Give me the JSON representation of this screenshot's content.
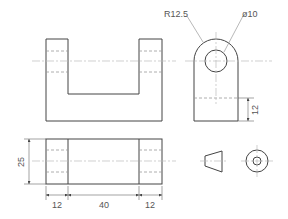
{
  "drawing": {
    "title": "Orthographic projection of a clevis bracket",
    "annotations": {
      "radius": "R12.5",
      "hole_diameter": "ø10"
    },
    "dimensions": {
      "side_slot_height": "12",
      "plan_width": "25",
      "left_upright": "12",
      "gap": "40",
      "right_upright": "12"
    },
    "views": [
      "front-view",
      "side-view",
      "plan-view",
      "projection-symbol"
    ],
    "colors": {
      "line": "#444444",
      "hidden": "#999999",
      "center": "#bbbbbb",
      "text": "#555555"
    }
  }
}
